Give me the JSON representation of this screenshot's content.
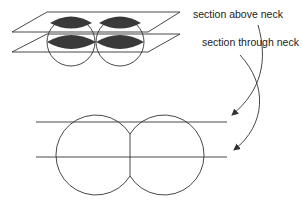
{
  "labels": {
    "section_above_neck": "section above neck",
    "section_through_neck": "section through neck"
  },
  "colors": {
    "stroke": "#333333",
    "lens_fill": "#3a3a3a",
    "background": "#ffffff"
  },
  "figure": {
    "top_view": {
      "description": "3D view of two touching spheres cut by two horizontal planes",
      "spheres": [
        {
          "cx": 71,
          "cy": 42,
          "r": 24
        },
        {
          "cx": 120,
          "cy": 42,
          "r": 24
        }
      ],
      "planes": [
        {
          "name": "upper-plane",
          "y_back": 12,
          "y_front": 32
        },
        {
          "name": "lower-plane",
          "y_back": 34,
          "y_front": 52
        }
      ]
    },
    "bottom_view": {
      "description": "Side view of two touching circles with two horizontal section lines",
      "circles": [
        {
          "cx": 95,
          "cy": 155,
          "r": 40
        },
        {
          "cx": 167,
          "cy": 155,
          "r": 40
        }
      ],
      "section_lines_y": [
        122,
        157
      ]
    }
  }
}
